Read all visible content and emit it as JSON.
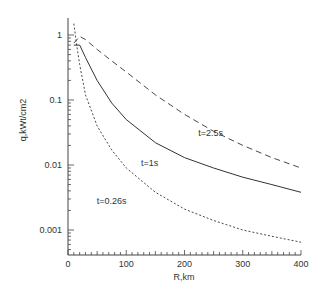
{
  "chart_data": {
    "type": "line",
    "title": "",
    "xlabel": "R,km",
    "ylabel": "q,kWt/cm2",
    "xlim": [
      0,
      400
    ],
    "ylim": [
      0.0006,
      2
    ],
    "yscale": "log",
    "grid": false,
    "legend": "inline labels",
    "x_ticks": [
      "0",
      "100",
      "200",
      "300",
      "400"
    ],
    "y_ticks": [
      "0.001",
      "0.01",
      "0.1",
      "1"
    ],
    "series": [
      {
        "name": "t=2.5s",
        "style": "dashed",
        "x": [
          10,
          20,
          30,
          50,
          75,
          100,
          150,
          200,
          250,
          300,
          350,
          400
        ],
        "y": [
          0.75,
          0.95,
          0.85,
          0.6,
          0.4,
          0.27,
          0.12,
          0.06,
          0.033,
          0.02,
          0.013,
          0.009
        ]
      },
      {
        "name": "t=1s",
        "style": "solid",
        "x": [
          10,
          20,
          30,
          50,
          75,
          100,
          150,
          200,
          250,
          300,
          350,
          400
        ],
        "y": [
          0.7,
          0.7,
          0.45,
          0.2,
          0.09,
          0.05,
          0.022,
          0.013,
          0.009,
          0.0065,
          0.005,
          0.0038
        ]
      },
      {
        "name": "t=0.26s",
        "style": "dotted",
        "x": [
          10,
          15,
          20,
          30,
          50,
          75,
          100,
          150,
          200,
          250,
          300,
          350,
          400
        ],
        "y": [
          1.5,
          0.7,
          0.35,
          0.12,
          0.04,
          0.017,
          0.009,
          0.0038,
          0.0021,
          0.0014,
          0.001,
          0.0008,
          0.00065
        ]
      }
    ],
    "annotations": [
      {
        "text": "t=2.5s",
        "x": 245,
        "y": 0.028
      },
      {
        "text": "t=1s",
        "x": 140,
        "y": 0.0095
      },
      {
        "text": "t=0.26s",
        "x": 75,
        "y": 0.0025
      }
    ]
  }
}
